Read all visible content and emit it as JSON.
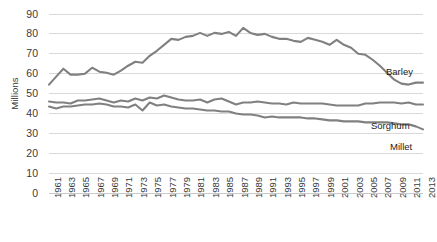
{
  "chart_data": {
    "type": "line",
    "title": "",
    "xlabel": "",
    "ylabel": "Millions",
    "ylim": [
      0,
      90
    ],
    "ytick_values": [
      0,
      10,
      20,
      30,
      40,
      50,
      60,
      70,
      80,
      90
    ],
    "ytick_labels": [
      "0",
      "10",
      "20",
      "30",
      "40",
      "50",
      "60",
      "70",
      "80",
      "90"
    ],
    "grid": true,
    "grid_axis": "y",
    "legend_position": "right-inline",
    "line_color": "#808080",
    "x": [
      1961,
      1962,
      1963,
      1964,
      1965,
      1966,
      1967,
      1968,
      1969,
      1970,
      1971,
      1972,
      1973,
      1974,
      1975,
      1976,
      1977,
      1978,
      1979,
      1980,
      1981,
      1982,
      1983,
      1984,
      1985,
      1986,
      1987,
      1988,
      1989,
      1990,
      1991,
      1992,
      1993,
      1994,
      1995,
      1996,
      1997,
      1998,
      1999,
      2000,
      2001,
      2002,
      2003,
      2004,
      2005,
      2006,
      2007,
      2008,
      2009,
      2010,
      2011,
      2012,
      2013
    ],
    "xtick_labels": [
      "1961",
      "1963",
      "1965",
      "1967",
      "1969",
      "1971",
      "1973",
      "1975",
      "1977",
      "1979",
      "1981",
      "1983",
      "1985",
      "1987",
      "1989",
      "1991",
      "1993",
      "1995",
      "1997",
      "1999",
      "2001",
      "2003",
      "2005",
      "2007",
      "2009",
      "2011",
      "2013"
    ],
    "series": [
      {
        "name": "Barley",
        "values": [
          54.5,
          58.5,
          62.5,
          59.5,
          59.5,
          60.0,
          63.0,
          61.0,
          60.5,
          59.5,
          61.5,
          64.0,
          66.0,
          65.5,
          69.0,
          71.5,
          74.5,
          77.5,
          77.0,
          78.5,
          79.0,
          80.5,
          79.0,
          80.5,
          80.0,
          81.0,
          79.0,
          83.0,
          80.5,
          79.5,
          80.0,
          78.5,
          77.5,
          77.5,
          76.5,
          76.0,
          78.0,
          77.0,
          76.0,
          74.5,
          77.0,
          74.5,
          73.0,
          70.0,
          69.5,
          67.0,
          64.0,
          60.5,
          57.0,
          55.0,
          54.5,
          55.5,
          55.5
        ]
      },
      {
        "name": "Sorghum",
        "values": [
          46.0,
          45.5,
          45.5,
          45.0,
          46.5,
          46.5,
          47.0,
          47.5,
          46.5,
          45.5,
          46.5,
          46.0,
          47.5,
          46.5,
          48.0,
          47.5,
          49.0,
          48.0,
          47.0,
          46.5,
          46.5,
          47.0,
          45.5,
          47.0,
          47.5,
          46.0,
          44.5,
          45.5,
          45.5,
          46.0,
          45.5,
          45.0,
          45.0,
          44.5,
          45.5,
          45.0,
          45.0,
          45.0,
          45.0,
          44.5,
          44.0,
          44.0,
          44.0,
          44.0,
          45.0,
          45.0,
          45.5,
          45.5,
          45.5,
          45.0,
          45.5,
          44.5,
          44.5
        ]
      },
      {
        "name": "Millet",
        "values": [
          43.5,
          42.5,
          43.5,
          43.5,
          44.0,
          44.5,
          44.5,
          45.0,
          44.5,
          43.5,
          43.5,
          43.0,
          44.5,
          41.5,
          45.5,
          44.0,
          44.5,
          43.5,
          43.0,
          42.5,
          42.5,
          42.0,
          41.5,
          41.5,
          41.0,
          41.0,
          40.0,
          39.5,
          39.5,
          39.0,
          38.0,
          38.5,
          38.0,
          38.0,
          38.0,
          38.0,
          37.5,
          37.5,
          37.0,
          36.5,
          36.5,
          36.0,
          36.0,
          36.0,
          35.5,
          35.5,
          35.5,
          35.5,
          35.0,
          34.5,
          34.5,
          33.5,
          32.0
        ]
      }
    ],
    "series_labels": [
      {
        "name": "Barley",
        "label": "Barley"
      },
      {
        "name": "Sorghum",
        "label": "Sorghum"
      },
      {
        "name": "Millet",
        "label": "Millet"
      }
    ]
  }
}
